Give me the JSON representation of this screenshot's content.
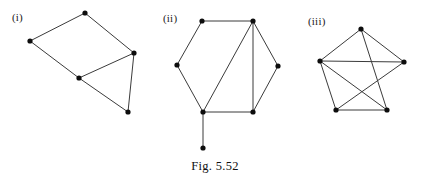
{
  "figure": {
    "caption": "Fig. 5.52",
    "panel_labels": {
      "first": "(i)",
      "second": "(ii)",
      "third": "(iii)"
    },
    "style": {
      "edge_color": "#3b3b3b",
      "vertex_color": "#0d0d0d",
      "background_color": "#ffffff",
      "vertex_radius": 2.6,
      "edge_width": 1
    },
    "graphs": [
      {
        "id": "graph-i",
        "label": "(i)",
        "vertex_count": 5,
        "edge_count": 6,
        "vertices": [
          {
            "name": "v1",
            "x": 30,
            "y": 41
          },
          {
            "name": "v2",
            "x": 85,
            "y": 13
          },
          {
            "name": "v3",
            "x": 134,
            "y": 53
          },
          {
            "name": "v4",
            "x": 79,
            "y": 78
          },
          {
            "name": "v5",
            "x": 128,
            "y": 112
          }
        ],
        "edges": [
          {
            "from": 0,
            "to": 1
          },
          {
            "from": 1,
            "to": 2
          },
          {
            "from": 0,
            "to": 3
          },
          {
            "from": 3,
            "to": 2
          },
          {
            "from": 3,
            "to": 4
          },
          {
            "from": 2,
            "to": 4
          }
        ]
      },
      {
        "id": "graph-ii",
        "label": "(ii)",
        "vertex_count": 7,
        "edge_count": 8,
        "vertices": [
          {
            "name": "v1",
            "x": 202,
            "y": 21
          },
          {
            "name": "v2",
            "x": 253,
            "y": 21
          },
          {
            "name": "v3",
            "x": 177,
            "y": 65
          },
          {
            "name": "v4",
            "x": 278,
            "y": 66
          },
          {
            "name": "v5",
            "x": 203,
            "y": 112
          },
          {
            "name": "v6",
            "x": 253,
            "y": 112
          },
          {
            "name": "v7",
            "x": 203,
            "y": 148
          }
        ],
        "edges": [
          {
            "from": 0,
            "to": 1
          },
          {
            "from": 0,
            "to": 2
          },
          {
            "from": 2,
            "to": 4
          },
          {
            "from": 1,
            "to": 3
          },
          {
            "from": 3,
            "to": 5
          },
          {
            "from": 4,
            "to": 5
          },
          {
            "from": 1,
            "to": 4
          },
          {
            "from": 1,
            "to": 5
          },
          {
            "from": 4,
            "to": 6
          }
        ]
      },
      {
        "id": "graph-iii",
        "label": "(iii)",
        "vertex_count": 5,
        "edge_count": 7,
        "vertices": [
          {
            "name": "v1",
            "x": 361,
            "y": 29
          },
          {
            "name": "v2",
            "x": 320,
            "y": 61
          },
          {
            "name": "v3",
            "x": 404,
            "y": 62
          },
          {
            "name": "v4",
            "x": 336,
            "y": 110
          },
          {
            "name": "v5",
            "x": 387,
            "y": 110
          }
        ],
        "edges": [
          {
            "from": 0,
            "to": 1
          },
          {
            "from": 0,
            "to": 2
          },
          {
            "from": 0,
            "to": 4
          },
          {
            "from": 1,
            "to": 2
          },
          {
            "from": 1,
            "to": 3
          },
          {
            "from": 1,
            "to": 4
          },
          {
            "from": 2,
            "to": 3
          },
          {
            "from": 3,
            "to": 4
          }
        ]
      }
    ]
  }
}
